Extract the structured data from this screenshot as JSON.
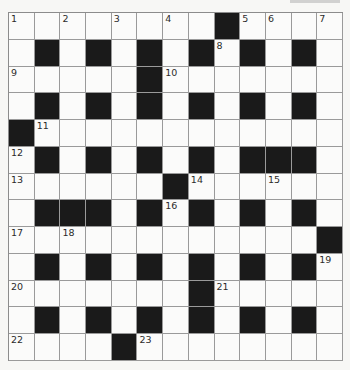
{
  "puzzle": {
    "type": "crossword",
    "rows": 13,
    "cols": 13,
    "grid": [
      "........#....",
      ".#.#.#.#.#.#.",
      ".....#.......",
      ".#.#.#.#.#.#.",
      "#............",
      ".#.#.#.#.###.",
      "......#......",
      ".###.#.#.#.#.",
      "............#",
      ".#.#.#.#.#.#.",
      ".......#.....",
      ".#.#.#.#.#.#.",
      "....#........"
    ],
    "numbers": [
      {
        "n": "1",
        "r": 0,
        "c": 0
      },
      {
        "n": "2",
        "r": 0,
        "c": 2
      },
      {
        "n": "3",
        "r": 0,
        "c": 4
      },
      {
        "n": "4",
        "r": 0,
        "c": 6
      },
      {
        "n": "5",
        "r": 0,
        "c": 9
      },
      {
        "n": "6",
        "r": 0,
        "c": 10
      },
      {
        "n": "7",
        "r": 0,
        "c": 12
      },
      {
        "n": "8",
        "r": 1,
        "c": 8
      },
      {
        "n": "9",
        "r": 2,
        "c": 0
      },
      {
        "n": "10",
        "r": 2,
        "c": 6
      },
      {
        "n": "11",
        "r": 4,
        "c": 1
      },
      {
        "n": "12",
        "r": 5,
        "c": 0
      },
      {
        "n": "13",
        "r": 6,
        "c": 0
      },
      {
        "n": "14",
        "r": 6,
        "c": 7
      },
      {
        "n": "15",
        "r": 6,
        "c": 10
      },
      {
        "n": "16",
        "r": 7,
        "c": 6
      },
      {
        "n": "17",
        "r": 8,
        "c": 0
      },
      {
        "n": "18",
        "r": 8,
        "c": 2
      },
      {
        "n": "19",
        "r": 9,
        "c": 12
      },
      {
        "n": "20",
        "r": 10,
        "c": 0
      },
      {
        "n": "21",
        "r": 10,
        "c": 8
      },
      {
        "n": "22",
        "r": 12,
        "c": 0
      },
      {
        "n": "23",
        "r": 12,
        "c": 5
      }
    ],
    "colors": {
      "black_square": "#1a1a1a",
      "white_square": "#fbfbfa",
      "grid_line": "#9a9a9a",
      "number_text": "#2b2b2b"
    }
  }
}
